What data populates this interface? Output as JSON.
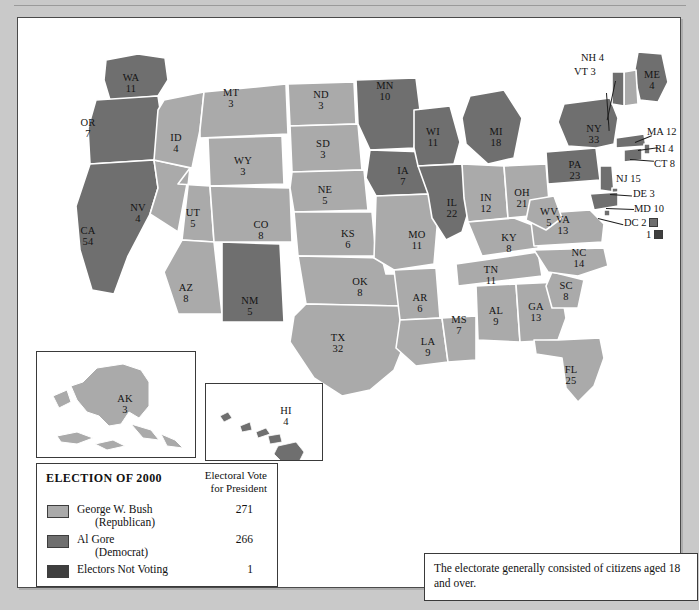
{
  "colors": {
    "bush": "#aaaaaa",
    "gore": "#6f6f6f",
    "not_voting": "#3f3f3f",
    "border": "#ffffff",
    "outline": "#3a3a3a",
    "page_bg": "#c9c9c9",
    "panel_bg": "#ffffff",
    "text": "#141414"
  },
  "legend": {
    "title": "ELECTION OF 2000",
    "column_header_line1": "Electoral Vote",
    "column_header_line2": "for President",
    "rows": [
      {
        "name": "George W. Bush",
        "party": "(Republican)",
        "votes": "271",
        "swatch": "bush"
      },
      {
        "name": "Al Gore",
        "party": "(Democrat)",
        "votes": "266",
        "swatch": "gore"
      },
      {
        "name": "Electors Not Voting",
        "party": "",
        "votes": "1",
        "swatch": "not_voting"
      }
    ]
  },
  "note": {
    "text": "The electorate generally consisted of citizens aged 18 and over."
  },
  "insets": {
    "alaska": {
      "abbr": "AK",
      "votes": "3",
      "winner": "bush"
    },
    "hawaii": {
      "abbr": "HI",
      "votes": "4",
      "winner": "gore"
    }
  },
  "callouts": {
    "nh": {
      "label": "NH 4"
    },
    "vt": {
      "label": "VT 3"
    },
    "ma": {
      "label": "MA 12"
    },
    "ri": {
      "label": "RI 4"
    },
    "ct": {
      "label": "CT 8"
    },
    "nj": {
      "label": "NJ 15"
    },
    "de": {
      "label": "DE 3"
    },
    "md": {
      "label": "MD 10"
    },
    "dc": {
      "label": "DC 2"
    },
    "notvoting": {
      "label": "1"
    }
  },
  "chart_data": {
    "type": "map",
    "title": "ELECTION OF 2000",
    "subtitle": "Electoral Vote for President",
    "categories": [
      "George W. Bush (Republican)",
      "Al Gore (Democrat)",
      "Electors Not Voting"
    ],
    "values": [
      271,
      266,
      1
    ],
    "total_electoral_votes": 538,
    "legend_position": "bottom-left",
    "states": [
      {
        "abbr": "WA",
        "votes": 11,
        "winner": "gore",
        "x": 113,
        "y": 65
      },
      {
        "abbr": "OR",
        "votes": 7,
        "winner": "gore",
        "x": 70,
        "y": 110
      },
      {
        "abbr": "CA",
        "votes": 54,
        "winner": "gore",
        "x": 70,
        "y": 218
      },
      {
        "abbr": "NV",
        "votes": 4,
        "winner": "bush",
        "x": 120,
        "y": 195
      },
      {
        "abbr": "ID",
        "votes": 4,
        "winner": "bush",
        "x": 158,
        "y": 125
      },
      {
        "abbr": "MT",
        "votes": 3,
        "winner": "bush",
        "x": 213,
        "y": 80
      },
      {
        "abbr": "WY",
        "votes": 3,
        "winner": "bush",
        "x": 225,
        "y": 148
      },
      {
        "abbr": "UT",
        "votes": 5,
        "winner": "bush",
        "x": 175,
        "y": 200
      },
      {
        "abbr": "AZ",
        "votes": 8,
        "winner": "bush",
        "x": 168,
        "y": 275
      },
      {
        "abbr": "NM",
        "votes": 5,
        "winner": "gore",
        "x": 232,
        "y": 288
      },
      {
        "abbr": "CO",
        "votes": 8,
        "winner": "bush",
        "x": 243,
        "y": 212
      },
      {
        "abbr": "ND",
        "votes": 3,
        "winner": "bush",
        "x": 303,
        "y": 82
      },
      {
        "abbr": "SD",
        "votes": 3,
        "winner": "bush",
        "x": 305,
        "y": 131
      },
      {
        "abbr": "NE",
        "votes": 5,
        "winner": "bush",
        "x": 307,
        "y": 177
      },
      {
        "abbr": "KS",
        "votes": 6,
        "winner": "bush",
        "x": 330,
        "y": 221
      },
      {
        "abbr": "OK",
        "votes": 8,
        "winner": "bush",
        "x": 342,
        "y": 269
      },
      {
        "abbr": "TX",
        "votes": 32,
        "winner": "bush",
        "x": 320,
        "y": 325
      },
      {
        "abbr": "MN",
        "votes": 10,
        "winner": "gore",
        "x": 367,
        "y": 73
      },
      {
        "abbr": "IA",
        "votes": 7,
        "winner": "gore",
        "x": 385,
        "y": 158
      },
      {
        "abbr": "MO",
        "votes": 11,
        "winner": "bush",
        "x": 399,
        "y": 222
      },
      {
        "abbr": "AR",
        "votes": 6,
        "winner": "bush",
        "x": 402,
        "y": 285
      },
      {
        "abbr": "LA",
        "votes": 9,
        "winner": "bush",
        "x": 410,
        "y": 329
      },
      {
        "abbr": "WI",
        "votes": 11,
        "winner": "gore",
        "x": 415,
        "y": 119
      },
      {
        "abbr": "IL",
        "votes": 22,
        "winner": "gore",
        "x": 434,
        "y": 190
      },
      {
        "abbr": "MS",
        "votes": 7,
        "winner": "bush",
        "x": 441,
        "y": 307
      },
      {
        "abbr": "MI",
        "votes": 18,
        "winner": "gore",
        "x": 478,
        "y": 119
      },
      {
        "abbr": "IN",
        "votes": 12,
        "winner": "bush",
        "x": 468,
        "y": 185
      },
      {
        "abbr": "KY",
        "votes": 8,
        "winner": "bush",
        "x": 491,
        "y": 225
      },
      {
        "abbr": "TN",
        "votes": 11,
        "winner": "bush",
        "x": 473,
        "y": 257
      },
      {
        "abbr": "AL",
        "votes": 9,
        "winner": "bush",
        "x": 478,
        "y": 298
      },
      {
        "abbr": "OH",
        "votes": 21,
        "winner": "bush",
        "x": 504,
        "y": 180
      },
      {
        "abbr": "GA",
        "votes": 13,
        "winner": "bush",
        "x": 518,
        "y": 294
      },
      {
        "abbr": "FL",
        "votes": 25,
        "winner": "bush",
        "x": 553,
        "y": 357
      },
      {
        "abbr": "SC",
        "votes": 8,
        "winner": "bush",
        "x": 548,
        "y": 273
      },
      {
        "abbr": "NC",
        "votes": 14,
        "winner": "bush",
        "x": 561,
        "y": 240
      },
      {
        "abbr": "VA",
        "votes": 13,
        "winner": "bush",
        "x": 545,
        "y": 207
      },
      {
        "abbr": "WV",
        "votes": 5,
        "winner": "bush",
        "x": 531,
        "y": 199
      },
      {
        "abbr": "PA",
        "votes": 23,
        "winner": "gore",
        "x": 557,
        "y": 152
      },
      {
        "abbr": "NY",
        "votes": 33,
        "winner": "gore",
        "x": 576,
        "y": 116
      },
      {
        "abbr": "ME",
        "votes": 4,
        "winner": "gore",
        "x": 634,
        "y": 62
      },
      {
        "abbr": "NH",
        "votes": 4,
        "winner": "bush",
        "x": 587,
        "y": 61
      },
      {
        "abbr": "VT",
        "votes": 3,
        "winner": "gore",
        "x": 585,
        "y": 73
      },
      {
        "abbr": "MA",
        "votes": 12,
        "winner": "gore",
        "x": 645,
        "y": 114
      },
      {
        "abbr": "RI",
        "votes": 4,
        "winner": "gore",
        "x": 645,
        "y": 131
      },
      {
        "abbr": "CT",
        "votes": 8,
        "winner": "gore",
        "x": 644,
        "y": 146
      },
      {
        "abbr": "NJ",
        "votes": 15,
        "winner": "gore",
        "x": 617,
        "y": 162
      },
      {
        "abbr": "DE",
        "votes": 3,
        "winner": "gore",
        "x": 620,
        "y": 178
      },
      {
        "abbr": "MD",
        "votes": 10,
        "winner": "gore",
        "x": 624,
        "y": 193
      },
      {
        "abbr": "DC",
        "votes": 2,
        "winner": "gore",
        "x": 617,
        "y": 208
      },
      {
        "abbr": "AK",
        "votes": 3,
        "winner": "bush",
        "x": 106,
        "y": 388
      },
      {
        "abbr": "HI",
        "votes": 4,
        "winner": "gore",
        "x": 268,
        "y": 398
      }
    ]
  }
}
